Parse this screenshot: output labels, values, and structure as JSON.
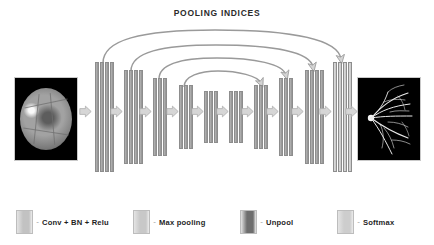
{
  "figure": {
    "title": "POOLING INDICES",
    "type": "segnet-encoder-decoder-architecture"
  },
  "input": {
    "name": "retinal-fundus-input-image",
    "alt": "grayscale retinal fundus photograph"
  },
  "output": {
    "name": "vessel-segmentation-output-image",
    "alt": "binary retinal vessel segmentation map"
  },
  "colors": {
    "conv": "#9a9a9a",
    "conv_light": "#c4c4c4",
    "maxpool": "#b8b8b8",
    "unpool": "#6e6e6e",
    "softmax": "#cdcdcd",
    "arrow_fill": "#d6d6d6",
    "arrow_stroke": "#a8a8a8",
    "curve": "#8f8f8f",
    "text": "#1f1f1f",
    "background": "#ffffff"
  },
  "encoder_blocks": [
    {
      "id": "enc1",
      "bars": 4,
      "x": 95,
      "top": 62,
      "height": 110,
      "barw": 4,
      "gap": 1,
      "kind": "conv"
    },
    {
      "id": "enc2",
      "bars": 4,
      "x": 124,
      "top": 70,
      "height": 94,
      "barw": 4,
      "gap": 1,
      "kind": "conv"
    },
    {
      "id": "enc3",
      "bars": 3,
      "x": 153,
      "top": 78,
      "height": 78,
      "barw": 4,
      "gap": 1,
      "kind": "conv"
    },
    {
      "id": "enc4",
      "bars": 3,
      "x": 179,
      "top": 85,
      "height": 64,
      "barw": 4,
      "gap": 1,
      "kind": "conv"
    },
    {
      "id": "enc5",
      "bars": 3,
      "x": 204,
      "top": 91,
      "height": 52,
      "barw": 4,
      "gap": 1,
      "kind": "conv"
    }
  ],
  "decoder_blocks": [
    {
      "id": "dec1",
      "bars": 3,
      "x": 229,
      "top": 91,
      "height": 52,
      "barw": 4,
      "gap": 1,
      "kind": "conv"
    },
    {
      "id": "dec2",
      "bars": 3,
      "x": 254,
      "top": 85,
      "height": 64,
      "barw": 4,
      "gap": 1,
      "kind": "conv"
    },
    {
      "id": "dec3",
      "bars": 3,
      "x": 279,
      "top": 78,
      "height": 78,
      "barw": 4,
      "gap": 1,
      "kind": "conv"
    },
    {
      "id": "dec4",
      "bars": 4,
      "x": 305,
      "top": 70,
      "height": 94,
      "barw": 4,
      "gap": 1,
      "kind": "conv"
    },
    {
      "id": "dec5",
      "bars": 4,
      "x": 333,
      "top": 62,
      "height": 110,
      "barw": 4,
      "gap": 1,
      "kind": "softmax"
    }
  ],
  "flow_arrows": [
    {
      "id": "flow-in",
      "x": 79,
      "y": 111
    },
    {
      "id": "flow-1-2",
      "x": 110,
      "y": 111
    },
    {
      "id": "flow-2-3",
      "x": 139,
      "y": 111
    },
    {
      "id": "flow-3-4",
      "x": 166,
      "y": 111
    },
    {
      "id": "flow-4-5",
      "x": 191,
      "y": 111
    },
    {
      "id": "flow-5-6",
      "x": 216,
      "y": 111
    },
    {
      "id": "flow-6-7",
      "x": 241,
      "y": 111
    },
    {
      "id": "flow-7-8",
      "x": 266,
      "y": 111
    },
    {
      "id": "flow-8-9",
      "x": 291,
      "y": 111
    },
    {
      "id": "flow-9-10",
      "x": 319,
      "y": 111
    },
    {
      "id": "flow-out",
      "x": 345,
      "y": 111
    }
  ],
  "pooling_curves": [
    {
      "id": "pool-indices-1",
      "from": "enc1",
      "to": "dec5",
      "x1": 103,
      "y1": 62,
      "x2": 340,
      "y2": 60,
      "arc": 40
    },
    {
      "id": "pool-indices-2",
      "from": "enc2",
      "to": "dec4",
      "x1": 131,
      "y1": 70,
      "x2": 312,
      "y2": 68,
      "arc": 31
    },
    {
      "id": "pool-indices-3",
      "from": "enc3",
      "to": "dec3",
      "x1": 159,
      "y1": 78,
      "x2": 285,
      "y2": 76,
      "arc": 24
    },
    {
      "id": "pool-indices-4",
      "from": "enc4",
      "to": "dec2",
      "x1": 184,
      "y1": 86,
      "x2": 260,
      "y2": 84,
      "arc": 16
    }
  ],
  "legend": {
    "items": [
      {
        "id": "legend-conv",
        "label": "Conv + BN + Relu",
        "color": "#c2c2c2",
        "x": 16,
        "separator": "-"
      },
      {
        "id": "legend-maxpool",
        "label": "Max pooling",
        "color": "#c8c8c8",
        "x": 133,
        "separator": "-"
      },
      {
        "id": "legend-unpool",
        "label": "Unpool",
        "color": "#6e6e6e",
        "x": 240,
        "separator": "-"
      },
      {
        "id": "legend-softmax",
        "label": "Softmax",
        "color": "#cdcdcd",
        "x": 337,
        "separator": "-"
      }
    ]
  }
}
